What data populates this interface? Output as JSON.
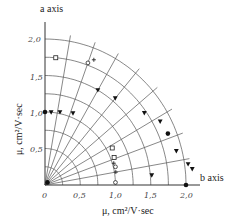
{
  "chart_data": {
    "type": "scatter",
    "subtype": "polar-quadrant",
    "title": "",
    "axis_a_label": "a axis",
    "axis_b_label": "b axis",
    "xlabel": "μ, cm²/V·sec",
    "ylabel": "μ, cm²/V·sec",
    "x_ticks": [
      "0",
      "0.5",
      "1.0",
      "1.5",
      "2.0"
    ],
    "y_ticks": [
      "0.5",
      "1.0",
      "1.5",
      "2.0"
    ],
    "r_range": [
      0,
      2.0
    ],
    "arc_step": 0.25,
    "radial_step_deg": 10,
    "grid": true,
    "series": [
      {
        "name": "filled circles",
        "marker": "circle-filled",
        "points_polar": [
          [
            1.0,
            90
          ],
          [
            2.0,
            0
          ],
          [
            1.88,
            22
          ],
          [
            0.05,
            45
          ]
        ]
      },
      {
        "name": "filled triangles",
        "marker": "triangle-down-filled",
        "points_polar": [
          [
            1.0,
            85
          ],
          [
            1.02,
            78
          ],
          [
            1.06,
            68
          ],
          [
            1.5,
            60
          ],
          [
            1.55,
            50
          ],
          [
            1.72,
            35
          ],
          [
            1.85,
            28
          ],
          [
            1.92,
            14
          ],
          [
            2.05,
            8
          ],
          [
            2.1,
            6
          ],
          [
            1.52,
            5
          ]
        ]
      },
      {
        "name": "open squares",
        "marker": "square-open",
        "points_polar": [
          [
            1.75,
            85
          ],
          [
            1.08,
            28
          ],
          [
            1.05,
            21
          ]
        ]
      },
      {
        "name": "open circles",
        "marker": "circle-open",
        "points_polar": [
          [
            1.78,
            70
          ],
          [
            1.0,
            2
          ],
          [
            1.03,
            14
          ]
        ]
      },
      {
        "name": "plus signs",
        "marker": "plus",
        "points_polar": [
          [
            1.85,
            68
          ],
          [
            1.02,
            17
          ],
          [
            1.02,
            10
          ]
        ]
      }
    ]
  },
  "labels": {
    "a_axis": "a axis",
    "b_axis": "b axis",
    "x_axis_title": "μ, cm²/V·sec",
    "y_axis_title": "μ, cm²/V·sec",
    "x_ticks": [
      "0",
      "0,5",
      "1,0",
      "1,5",
      "2,0"
    ],
    "y_ticks": [
      "0,5",
      "1,0",
      "1,5",
      "2,0"
    ]
  }
}
